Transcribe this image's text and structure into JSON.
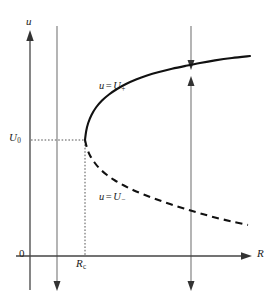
{
  "figure": {
    "type": "bifurcation-diagram",
    "caption_present": false,
    "background_color": "#ffffff",
    "curve_color": "#111111",
    "axis_color": "#444444",
    "flow_color": "#777777"
  },
  "axes": {
    "y_label": "u",
    "x_label": "R",
    "origin_label": "0",
    "y_tick_label": "U",
    "y_tick_sub": "0",
    "x_tick_label": "R",
    "x_tick_sub": "c"
  },
  "branches": [
    {
      "name": "upper-stable-branch",
      "label_base": "u",
      "label_op": "=",
      "label_var": "U",
      "label_sign": "+",
      "style": "solid",
      "meaning": "stable"
    },
    {
      "name": "lower-unstable-branch",
      "label_base": "u",
      "label_op": "=",
      "label_var": "U",
      "label_sign": "−",
      "style": "dashed",
      "meaning": "unstable"
    }
  ],
  "chart_data": {
    "type": "line",
    "title": "",
    "xlabel": "R",
    "ylabel": "u",
    "grid": false,
    "legend": "inline-annotations",
    "xlim": [
      0,
      1
    ],
    "ylim": [
      0,
      1
    ],
    "annotations": [
      {
        "text": "u = U₊",
        "x_px": 99,
        "y_px": 81
      },
      {
        "text": "u = U₋",
        "x_px": 99,
        "y_px": 192
      },
      {
        "text": "U₀",
        "x_px": 9,
        "y_px": 132
      },
      {
        "text": "Rᴄ",
        "x_px": 76,
        "y_px": 258
      },
      {
        "text": "0",
        "x_px": 19,
        "y_px": 248
      },
      {
        "text": "u",
        "x_px": 26,
        "y_px": 16
      },
      {
        "text": "R",
        "x_px": 257,
        "y_px": 248
      }
    ],
    "bifurcation_point": {
      "label": "(R_c, U_0)",
      "x_px": 85,
      "y_px": 140
    },
    "series": [
      {
        "name": "u = U+",
        "style": "solid",
        "points_px": [
          [
            85,
            140
          ],
          [
            86.2,
            131
          ],
          [
            88.2,
            123
          ],
          [
            91.5,
            115
          ],
          [
            96,
            107.5
          ],
          [
            102,
            100.5
          ],
          [
            109,
            94.5
          ],
          [
            117,
            89
          ],
          [
            126,
            84
          ],
          [
            136,
            79.5
          ],
          [
            147,
            75.5
          ],
          [
            159,
            72
          ],
          [
            172,
            68.8
          ],
          [
            186,
            65.8
          ],
          [
            200,
            63
          ],
          [
            215,
            60.4
          ],
          [
            232,
            58
          ],
          [
            250,
            56
          ]
        ]
      },
      {
        "name": "u = U-",
        "style": "dashed",
        "points_px": [
          [
            85,
            140
          ],
          [
            87,
            148
          ],
          [
            90,
            155.5
          ],
          [
            94.5,
            162.5
          ],
          [
            100,
            169
          ],
          [
            107,
            175
          ],
          [
            115,
            180.5
          ],
          [
            124,
            185.5
          ],
          [
            134,
            190.5
          ],
          [
            145,
            195
          ],
          [
            157,
            199.5
          ],
          [
            170,
            204
          ],
          [
            184,
            208.5
          ],
          [
            199,
            213
          ],
          [
            215,
            217.5
          ],
          [
            232,
            221.5
          ],
          [
            248,
            225
          ]
        ]
      }
    ],
    "flow_lines": [
      {
        "name": "left-flow-line",
        "x_px": 57,
        "direction": "down",
        "top_px": 26,
        "bottom_px": 290
      },
      {
        "name": "right-flow-line-upper",
        "x_px": 191,
        "direction": "down",
        "top_px": 26,
        "bottom_px": 69
      },
      {
        "name": "right-flow-line-middle",
        "x_px": 191,
        "direction": "up",
        "top_px": 77,
        "bottom_px": 256
      },
      {
        "name": "right-flow-line-lower",
        "x_px": 191,
        "direction": "down",
        "top_px": 256,
        "bottom_px": 290
      }
    ]
  }
}
